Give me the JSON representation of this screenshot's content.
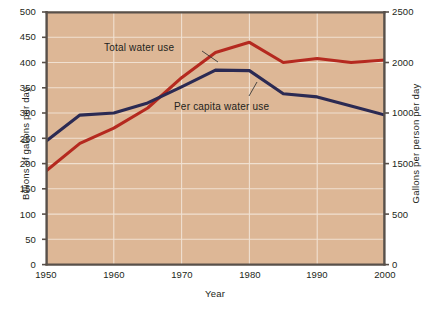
{
  "chart_data": {
    "type": "line",
    "title": "",
    "xlabel": "Year",
    "ylabel": "Billions of gallons per day",
    "ylabel_right": "Gallons per person per day",
    "x": [
      1950,
      1955,
      1960,
      1965,
      1970,
      1975,
      1980,
      1985,
      1990,
      1995,
      2000
    ],
    "xlim": [
      1950,
      2000
    ],
    "ylim": [
      0,
      500
    ],
    "ylim_right": [
      0,
      2500
    ],
    "grid": true,
    "legend_position": "inline-annotations",
    "xticks": [
      "1950",
      "1960",
      "1970",
      "1980",
      "1990",
      "2000"
    ],
    "xtick_values": [
      1950,
      1960,
      1970,
      1980,
      1990,
      2000
    ],
    "yticks_left": [
      "0",
      "50",
      "100",
      "150",
      "200",
      "250",
      "300",
      "350",
      "400",
      "450",
      "500"
    ],
    "ytick_values_left": [
      0,
      50,
      100,
      150,
      200,
      250,
      300,
      350,
      400,
      450,
      500
    ],
    "yticks_right": [
      "0",
      "500",
      "1000",
      "1500",
      "2000",
      "2500"
    ],
    "ytick_values_right": [
      0,
      500,
      1000,
      1500,
      2000,
      2500
    ],
    "series": [
      {
        "name": "Total water use",
        "color": "#b5291f",
        "axis": "left",
        "units": "billions of gallons per day",
        "values": [
          185,
          240,
          270,
          310,
          370,
          420,
          440,
          400,
          408,
          400,
          405
        ]
      },
      {
        "name": "Per capita water use",
        "color": "#2b2a53",
        "axis": "right",
        "units": "gallons per person per day",
        "values": [
          1220,
          1480,
          1500,
          1600,
          1760,
          1925,
          1920,
          1690,
          1660,
          1570,
          1480
        ]
      }
    ],
    "annotations": [
      {
        "text": "Total water use",
        "x": 1963,
        "y": 452
      },
      {
        "text": "Per capita water use",
        "x": 1974,
        "y": 330
      }
    ],
    "colors": {
      "plot_background": "#ddb796",
      "gridline": "#f0e0d0",
      "axis_line": "#58504a",
      "text": "#231f20",
      "series_total": "#b5291f",
      "series_per_capita": "#2b2a53"
    }
  }
}
